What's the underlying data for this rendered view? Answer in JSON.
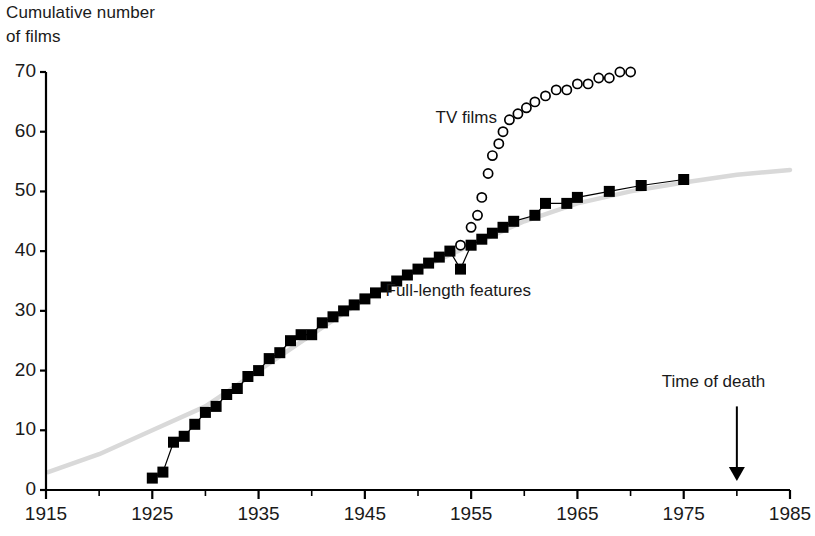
{
  "title": {
    "line1": "Cumulative number",
    "line2": "of films"
  },
  "axes": {
    "y_ticks": [
      "70",
      "60",
      "50",
      "40",
      "30",
      "20",
      "10",
      "0"
    ],
    "x_ticks": [
      "1915",
      "1925",
      "1935",
      "1945",
      "1955",
      "1965",
      "1975",
      "1985"
    ]
  },
  "annotations": {
    "tv_films": "TV films",
    "features": "Full-length features",
    "death": "Time of death"
  },
  "colors": {
    "marker": "#000000",
    "axis": "#000000",
    "trend": "#d9d9d9"
  },
  "chart_data": {
    "type": "scatter",
    "title": "Cumulative number of films",
    "xlabel": "",
    "ylabel": "Cumulative number of films",
    "xlim": [
      1915,
      1985
    ],
    "ylim": [
      0,
      70
    ],
    "xticks": [
      1915,
      1925,
      1935,
      1945,
      1955,
      1965,
      1975,
      1985
    ],
    "xminorticks": [
      1920,
      1930,
      1940,
      1950,
      1960,
      1970,
      1980
    ],
    "yticks": [
      0,
      10,
      20,
      30,
      40,
      50,
      60,
      70
    ],
    "grid": false,
    "legend": "inline-annotations",
    "series": [
      {
        "name": "Full-length features",
        "marker": "filled-square",
        "color": "#000000",
        "label_position": {
          "x": 1962,
          "y": 33
        },
        "points": [
          {
            "x": 1925,
            "y": 2
          },
          {
            "x": 1926,
            "y": 3
          },
          {
            "x": 1927,
            "y": 8
          },
          {
            "x": 1928,
            "y": 9
          },
          {
            "x": 1929,
            "y": 11
          },
          {
            "x": 1930,
            "y": 13
          },
          {
            "x": 1931,
            "y": 14
          },
          {
            "x": 1932,
            "y": 16
          },
          {
            "x": 1933,
            "y": 17
          },
          {
            "x": 1934,
            "y": 19
          },
          {
            "x": 1935,
            "y": 20
          },
          {
            "x": 1936,
            "y": 22
          },
          {
            "x": 1937,
            "y": 23
          },
          {
            "x": 1938,
            "y": 25
          },
          {
            "x": 1939,
            "y": 26
          },
          {
            "x": 1940,
            "y": 26
          },
          {
            "x": 1941,
            "y": 28
          },
          {
            "x": 1942,
            "y": 29
          },
          {
            "x": 1943,
            "y": 30
          },
          {
            "x": 1944,
            "y": 31
          },
          {
            "x": 1945,
            "y": 32
          },
          {
            "x": 1946,
            "y": 33
          },
          {
            "x": 1947,
            "y": 34
          },
          {
            "x": 1948,
            "y": 35
          },
          {
            "x": 1949,
            "y": 36
          },
          {
            "x": 1950,
            "y": 37
          },
          {
            "x": 1951,
            "y": 38
          },
          {
            "x": 1952,
            "y": 39
          },
          {
            "x": 1953,
            "y": 40
          },
          {
            "x": 1954,
            "y": 37
          },
          {
            "x": 1955,
            "y": 41
          },
          {
            "x": 1956,
            "y": 42
          },
          {
            "x": 1957,
            "y": 43
          },
          {
            "x": 1958,
            "y": 44
          },
          {
            "x": 1959,
            "y": 45
          },
          {
            "x": 1961,
            "y": 46
          },
          {
            "x": 1962,
            "y": 48
          },
          {
            "x": 1964,
            "y": 48
          },
          {
            "x": 1965,
            "y": 49
          },
          {
            "x": 1968,
            "y": 50
          },
          {
            "x": 1971,
            "y": 51
          },
          {
            "x": 1975,
            "y": 52
          }
        ]
      },
      {
        "name": "TV films",
        "marker": "open-circle",
        "color": "#000000",
        "label_position": {
          "x": 1962,
          "y": 62
        },
        "points": [
          {
            "x": 1954,
            "y": 41
          },
          {
            "x": 1955,
            "y": 44
          },
          {
            "x": 1955.6,
            "y": 46
          },
          {
            "x": 1956,
            "y": 49
          },
          {
            "x": 1956.6,
            "y": 53
          },
          {
            "x": 1957,
            "y": 56
          },
          {
            "x": 1957.6,
            "y": 58
          },
          {
            "x": 1958,
            "y": 60
          },
          {
            "x": 1958.6,
            "y": 62
          },
          {
            "x": 1959.4,
            "y": 63
          },
          {
            "x": 1960.2,
            "y": 64
          },
          {
            "x": 1961,
            "y": 65
          },
          {
            "x": 1962,
            "y": 66
          },
          {
            "x": 1963,
            "y": 67
          },
          {
            "x": 1964,
            "y": 67
          },
          {
            "x": 1965,
            "y": 68
          },
          {
            "x": 1966,
            "y": 68
          },
          {
            "x": 1967,
            "y": 69
          },
          {
            "x": 1968,
            "y": 69
          },
          {
            "x": 1969,
            "y": 70
          },
          {
            "x": 1970,
            "y": 70
          }
        ]
      },
      {
        "name": "trend-line",
        "marker": "line",
        "color": "#d9d9d9",
        "points": [
          {
            "x": 1915.2,
            "y": 3
          },
          {
            "x": 1920,
            "y": 6
          },
          {
            "x": 1925,
            "y": 10
          },
          {
            "x": 1930,
            "y": 14
          },
          {
            "x": 1935,
            "y": 20
          },
          {
            "x": 1940,
            "y": 26
          },
          {
            "x": 1945,
            "y": 32
          },
          {
            "x": 1950,
            "y": 37
          },
          {
            "x": 1955,
            "y": 41
          },
          {
            "x": 1960,
            "y": 45
          },
          {
            "x": 1965,
            "y": 48
          },
          {
            "x": 1970,
            "y": 50
          },
          {
            "x": 1975,
            "y": 51.5
          },
          {
            "x": 1980,
            "y": 52.8
          },
          {
            "x": 1985,
            "y": 53.6
          }
        ]
      }
    ],
    "markers": [
      {
        "name": "Time of death",
        "type": "arrow",
        "x": 1980,
        "y_from": 14,
        "y_to": 1.5
      }
    ]
  }
}
